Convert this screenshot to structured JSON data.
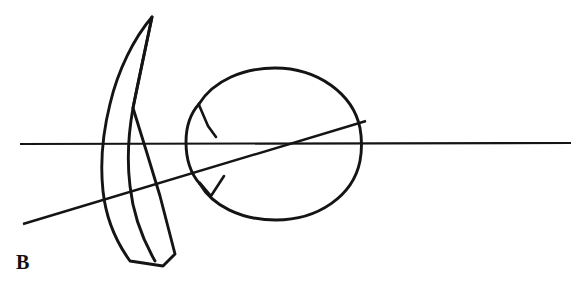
{
  "figure": {
    "panel_label": "B",
    "caption": "",
    "background_color": "#ffffff",
    "ink_color": "#141414",
    "width": 580,
    "height": 291
  },
  "diagram": {
    "type": "line-art schematic",
    "elements": [
      {
        "name": "horizontal-axis-line",
        "label": "",
        "kind": "straight-line",
        "x1": 20,
        "y1": 144,
        "x2": 571,
        "y2": 143,
        "stroke_width": 2.1
      },
      {
        "name": "oblique-axis-line",
        "label": "",
        "kind": "straight-line",
        "x1": 23,
        "y1": 224,
        "x2": 366,
        "y2": 121,
        "stroke_width": 2.4
      },
      {
        "name": "eye-globe-circle",
        "label": "",
        "kind": "circle",
        "center_x": 282,
        "center_y": 144,
        "radius": 76,
        "stroke_width": 2.9
      },
      {
        "name": "cornea-bulge",
        "label": "",
        "kind": "arc",
        "stroke_width": 2.9
      },
      {
        "name": "limbus-tick-upper",
        "label": "",
        "kind": "tick-mark",
        "stroke_width": 2.6
      },
      {
        "name": "limbus-tick-lower",
        "label": "",
        "kind": "tick-mark",
        "stroke_width": 2.6
      },
      {
        "name": "surgical-blade",
        "label": "",
        "kind": "closed-curved-outline",
        "tip_x": 152,
        "tip_y": 17,
        "base_x": 163,
        "base_y": 266,
        "stroke_width": 2.9
      }
    ]
  }
}
